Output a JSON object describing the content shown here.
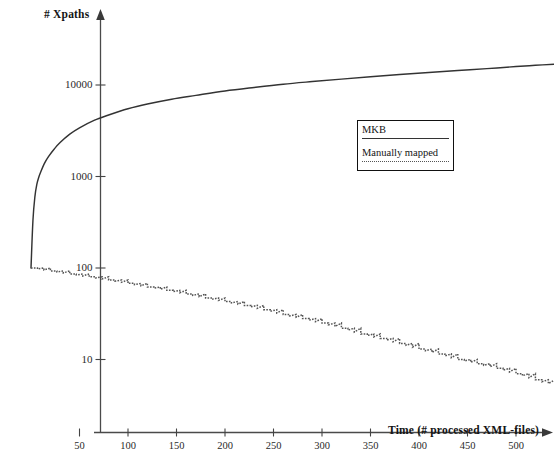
{
  "chart_data": {
    "type": "line",
    "title": "",
    "xlabel": "Time (# processed XML-files)",
    "ylabel": "# Xpaths",
    "yscale": "log",
    "xscale": "linear",
    "xlim": [
      0,
      545
    ],
    "ylim": [
      4,
      40000
    ],
    "grid": false,
    "legend_position": "upper-right-inside",
    "xticks": [
      50,
      100,
      150,
      200,
      250,
      300,
      350,
      400,
      450,
      500
    ],
    "yticks": [
      10,
      100,
      1000,
      10000
    ],
    "ytick_labels": [
      "10",
      "100",
      "1000",
      "10000"
    ],
    "xtick_labels": [
      "50",
      "100",
      "150",
      "200",
      "250",
      "300",
      "350",
      "400",
      "450",
      "500"
    ],
    "series": [
      {
        "name": "MKB",
        "style": "solid",
        "color": "#333333",
        "x": [
          0,
          2,
          4,
          6,
          8,
          10,
          14,
          18,
          24,
          30,
          40,
          50,
          65,
          80,
          100,
          120,
          145,
          170,
          200,
          230,
          260,
          290,
          320,
          350,
          380,
          410,
          440,
          470,
          500,
          520,
          540
        ],
        "y": [
          100,
          330,
          600,
          820,
          980,
          1120,
          1400,
          1650,
          2000,
          2350,
          2900,
          3400,
          4100,
          4700,
          5500,
          6200,
          7000,
          7700,
          8600,
          9400,
          10200,
          10900,
          11600,
          12300,
          13000,
          13700,
          14400,
          15100,
          15900,
          16400,
          16900
        ]
      },
      {
        "name": "Manually mapped",
        "style": "dotted",
        "color": "#555555",
        "x": [
          0,
          20,
          40,
          60,
          80,
          100,
          120,
          140,
          160,
          180,
          200,
          220,
          240,
          260,
          280,
          300,
          320,
          340,
          360,
          380,
          400,
          420,
          440,
          460,
          480,
          500,
          520,
          540
        ],
        "y": [
          100,
          93,
          86,
          80,
          74,
          68,
          62,
          57,
          52,
          47,
          43,
          39,
          35,
          31,
          28,
          25,
          22,
          19,
          17,
          15,
          13,
          11.5,
          10,
          9,
          8,
          7,
          6,
          5.2
        ]
      }
    ],
    "annotations": []
  },
  "axes": {
    "y_axis_label": "# Xpaths",
    "x_axis_label": "Time (# processed XML-files)"
  },
  "legend": {
    "entries": [
      {
        "label": "MKB",
        "style": "solid"
      },
      {
        "label": "Manually mapped",
        "style": "dotted"
      }
    ]
  },
  "colors": {
    "background": "#ffffff",
    "axis": "#444444",
    "mkb_line": "#333333",
    "manual_line": "#555555",
    "text": "#141414"
  }
}
